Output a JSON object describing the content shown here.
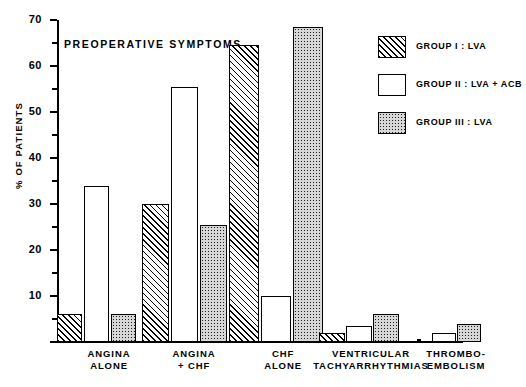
{
  "chart_data": {
    "type": "bar",
    "title": "PREOPERATIVE SYMPTOMS",
    "xlabel": "",
    "ylabel": "% OF PATIENTS",
    "ylim": [
      0,
      70
    ],
    "yticks": [
      0,
      10,
      20,
      30,
      40,
      50,
      60,
      70
    ],
    "ytick_labels": [
      "",
      "10",
      "20",
      "30",
      "40",
      "50",
      "60",
      "70"
    ],
    "yminor_ticks": [
      5,
      15,
      25,
      35,
      45,
      55,
      65
    ],
    "grid": false,
    "legend_position": "upper right",
    "categories": [
      "ANGINA ALONE",
      "ANGINA + CHF",
      "CHF ALONE",
      "VENTRICULAR TACHYARRHYTHMIAS",
      "THROMBO-EMBOLISM"
    ],
    "category_lines": [
      [
        "ANGINA",
        "ALONE"
      ],
      [
        "ANGINA",
        "+ CHF"
      ],
      [
        "CHF",
        "ALONE"
      ],
      [
        "VENTRICULAR",
        "TACHYARRHYTHMIAS"
      ],
      [
        "THROMBO-",
        "EMBOLISM"
      ]
    ],
    "series": [
      {
        "name": "GROUP I : LVA",
        "fill": "diagonal-hatch",
        "values": [
          6.0,
          30.0,
          64.5,
          2.0,
          0.0
        ]
      },
      {
        "name": "GROUP II : LVA + ACB",
        "fill": "open",
        "values": [
          34.0,
          55.5,
          10.0,
          3.5,
          2.0
        ]
      },
      {
        "name": "GROUP III : LVA",
        "fill": "dotted",
        "values": [
          6.0,
          25.5,
          68.5,
          6.0,
          4.0
        ]
      }
    ]
  },
  "legend": {
    "items": [
      {
        "label": "GROUP  I : LVA"
      },
      {
        "label": "GROUP  II : LVA + ACB"
      },
      {
        "label": "GROUP  III : LVA"
      }
    ]
  },
  "colors": {
    "axis": "#000000",
    "bar_outline": "#000000",
    "group1_fill": "#fdfdfd",
    "group2_fill": "#ffffff",
    "group3_fill": "#d7d7d7",
    "background": "#ffffff"
  }
}
